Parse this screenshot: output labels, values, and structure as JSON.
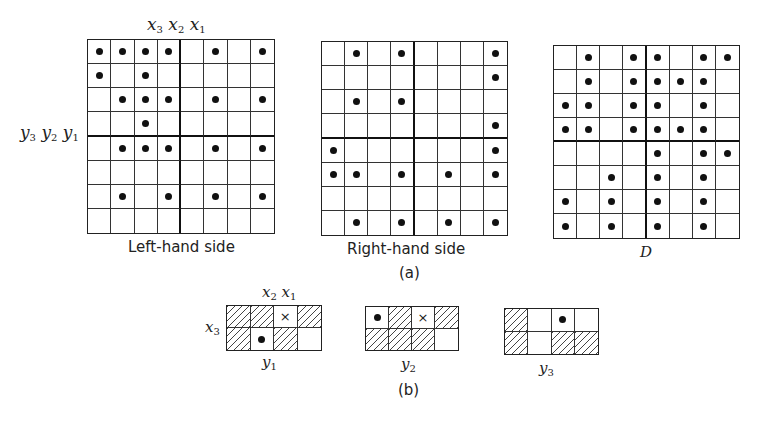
{
  "part_a": {
    "caption": "(a)",
    "top_vars": "x3 x2 x1",
    "side_vars": "y3 y2 y1",
    "grids": [
      {
        "id": "left-hand-side",
        "label": "Left-hand side",
        "rows": 8,
        "cols": 8,
        "dots": [
          [
            0,
            1,
            2,
            3,
            5,
            7
          ],
          [
            0,
            2
          ],
          [
            1,
            2,
            3,
            5,
            7
          ],
          [
            2
          ],
          [
            1,
            2,
            3,
            5,
            7
          ],
          [],
          [
            1,
            3,
            5,
            7
          ],
          []
        ]
      },
      {
        "id": "right-hand-side",
        "label": "Right-hand side",
        "rows": 8,
        "cols": 8,
        "dots": [
          [
            1,
            3,
            7
          ],
          [
            7
          ],
          [
            1,
            3
          ],
          [
            7
          ],
          [
            0,
            7
          ],
          [
            0,
            1,
            3,
            5,
            7
          ],
          [],
          [
            1,
            3,
            5,
            7
          ]
        ]
      },
      {
        "id": "d",
        "label": "D",
        "rows": 8,
        "cols": 8,
        "dots": [
          [
            1,
            3,
            4,
            6,
            7
          ],
          [
            1,
            3,
            4,
            5,
            6
          ],
          [
            0,
            1,
            3,
            4,
            6
          ],
          [
            0,
            1,
            3,
            4,
            5,
            6
          ],
          [
            4,
            6,
            7
          ],
          [
            2,
            4,
            6
          ],
          [
            0,
            2,
            4,
            6
          ],
          [
            0,
            2,
            4,
            6
          ]
        ]
      }
    ]
  },
  "part_b": {
    "caption": "(b)",
    "top_vars": "x2 x1",
    "side_var": "x3",
    "grids": [
      {
        "id": "y1",
        "label": "y1",
        "cells": [
          [
            "hatch",
            "hatch",
            "cross",
            "hatch"
          ],
          [
            "hatch",
            "dot",
            "hatch",
            "empty"
          ]
        ]
      },
      {
        "id": "y2",
        "label": "y2",
        "cells": [
          [
            "dot",
            "hatch",
            "cross",
            "hatch"
          ],
          [
            "hatch",
            "hatch",
            "hatch",
            "empty"
          ]
        ]
      },
      {
        "id": "y3",
        "label": "y3",
        "cells": [
          [
            "hatch",
            "empty",
            "dot",
            "empty"
          ],
          [
            "hatch",
            "empty",
            "hatch",
            "hatch"
          ]
        ]
      }
    ]
  }
}
